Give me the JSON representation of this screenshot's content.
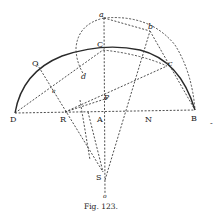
{
  "figure": {
    "caption": "Fig. 123.",
    "points": {
      "D": "D",
      "R": "R",
      "A": "A",
      "N": "N",
      "B": "B",
      "C": "C",
      "P": "P",
      "S": "S",
      "o": "o",
      "Q": "Q",
      "e": "e",
      "d": "d",
      "a": "a",
      "b": "b",
      "c": "c"
    }
  },
  "stray_mark": "-"
}
